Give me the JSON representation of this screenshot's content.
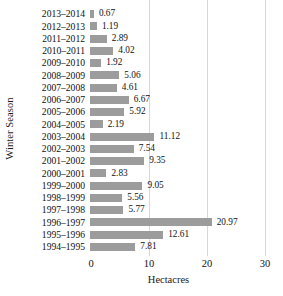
{
  "chart_data": {
    "type": "bar",
    "orientation": "horizontal",
    "title": "",
    "xlabel": "Hectacres",
    "ylabel": "Winter Season",
    "xlim": [
      0,
      33
    ],
    "xticks": [
      0,
      10,
      20,
      30
    ],
    "xtick_labels": [
      "0",
      "10",
      "20",
      "30"
    ],
    "gridlines": {
      "vertical_at": [
        10,
        20,
        30
      ],
      "horizontal": false
    },
    "bar_color": "#9c9c9c",
    "gridline_color": "#d8d8d8",
    "text_color": "#111111",
    "legend": null,
    "value_labels": true,
    "categories": [
      "2013–2014",
      "2012–2013",
      "2011–2012",
      "2010–2011",
      "2009–2010",
      "2008–2009",
      "2007–2008",
      "2006–2007",
      "2005–2006",
      "2004–2005",
      "2003–2004",
      "2002–2003",
      "2001–2002",
      "2000–2001",
      "1999–2000",
      "1998–1999",
      "1997–1998",
      "1996–1997",
      "1995–1996",
      "1994–1995"
    ],
    "values": [
      0.67,
      1.19,
      2.89,
      4.02,
      1.92,
      5.06,
      4.61,
      6.67,
      5.92,
      2.19,
      11.12,
      7.54,
      9.35,
      2.83,
      9.05,
      5.56,
      5.77,
      20.97,
      12.61,
      7.81
    ],
    "value_label_texts": [
      "0.67",
      "1.19",
      "2.89",
      "4.02",
      "1.92",
      "5.06",
      "4.61",
      "6.67",
      "5.92",
      "2.19",
      "11.12",
      "7.54",
      "9.35",
      "2.83",
      "9.05",
      "5.56",
      "5.77",
      "20.97",
      "12.61",
      "7.81"
    ]
  }
}
